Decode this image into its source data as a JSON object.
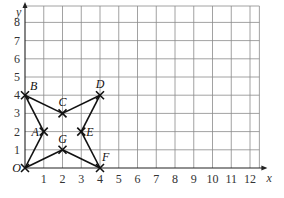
{
  "chart_data": {
    "type": "scatter",
    "title": "",
    "xlabel": "x",
    "ylabel": "y",
    "origin_label": "O",
    "xlim": [
      0,
      12.5
    ],
    "ylim": [
      0,
      8.8
    ],
    "grid": true,
    "x_ticks": [
      "1",
      "2",
      "3",
      "4",
      "5",
      "6",
      "7",
      "8",
      "9",
      "10",
      "11",
      "12"
    ],
    "y_ticks": [
      "1",
      "2",
      "3",
      "4",
      "5",
      "6",
      "7",
      "8"
    ],
    "points": [
      {
        "label": "O",
        "x": 0,
        "y": 0
      },
      {
        "label": "A",
        "x": 1,
        "y": 2
      },
      {
        "label": "B",
        "x": 0,
        "y": 4
      },
      {
        "label": "C",
        "x": 2,
        "y": 3
      },
      {
        "label": "D",
        "x": 4,
        "y": 4
      },
      {
        "label": "E",
        "x": 3,
        "y": 2
      },
      {
        "label": "F",
        "x": 4,
        "y": 0
      },
      {
        "label": "G",
        "x": 2,
        "y": 1
      }
    ],
    "segments": [
      [
        "O",
        "A"
      ],
      [
        "A",
        "B"
      ],
      [
        "B",
        "C"
      ],
      [
        "C",
        "D"
      ],
      [
        "D",
        "E"
      ],
      [
        "E",
        "F"
      ],
      [
        "F",
        "G"
      ],
      [
        "G",
        "O"
      ]
    ]
  }
}
